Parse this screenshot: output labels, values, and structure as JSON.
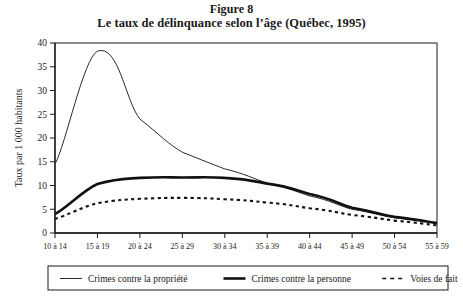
{
  "figure": {
    "number_label": "Figure 8",
    "caption": "Le taux de délinquance selon l’âge (Québec, 1995)"
  },
  "chart_data": {
    "type": "line",
    "title": "Le taux de délinquance selon l’âge (Québec, 1995)",
    "subtitle": "Figure 8",
    "xlabel": "",
    "ylabel": "Taux par 1 000 habitants",
    "categories": [
      "10 à 14",
      "15 à 19",
      "20 à 24",
      "25 à 29",
      "30 à 34",
      "35 à 39",
      "40 à 44",
      "45 à 49",
      "50 à 54",
      "55 à 59"
    ],
    "xtick_labels": [
      "10 à 14",
      "15 à 19",
      "20 à 24",
      "25 à 29",
      "30 à 34",
      "35 à 39",
      "40 à 44",
      "45 à 49",
      "50 à 54",
      "55 à 59"
    ],
    "ytick_labels": [
      "0",
      "5",
      "10",
      "15",
      "20",
      "25",
      "30",
      "35",
      "40"
    ],
    "yticks": [
      0,
      5,
      10,
      15,
      20,
      25,
      30,
      35,
      40
    ],
    "ylim": [
      0,
      40
    ],
    "grid": false,
    "legend_position": "bottom",
    "series": [
      {
        "name": "Crimes contre la propriété",
        "style": "solid-thin",
        "color": "#2b2b2b",
        "values": [
          14.5,
          38.3,
          24.0,
          17.0,
          13.5,
          10.5,
          7.8,
          5.0,
          3.2,
          2.2
        ]
      },
      {
        "name": "Crimes contre la personne",
        "style": "solid-thick",
        "color": "#111111",
        "values": [
          4.0,
          10.3,
          11.6,
          11.7,
          11.6,
          10.4,
          8.2,
          5.3,
          3.4,
          2.1
        ]
      },
      {
        "name": "Voies de fait",
        "style": "dashed",
        "color": "#111111",
        "values": [
          3.0,
          6.3,
          7.2,
          7.4,
          7.1,
          6.4,
          5.2,
          3.8,
          2.6,
          1.6
        ]
      }
    ]
  },
  "legend": {
    "items": [
      {
        "label": "Crimes contre la propriété",
        "style": "solid-thin"
      },
      {
        "label": "Crimes contre la personne",
        "style": "solid-thick"
      },
      {
        "label": "Voies de fait",
        "style": "dashed"
      }
    ]
  }
}
